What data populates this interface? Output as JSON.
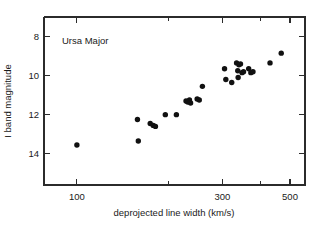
{
  "chart_data": {
    "type": "scatter",
    "title": "Ursa Major",
    "xlabel": "deprojected line width  (km/s)",
    "ylabel": "I band magnitude",
    "xscale": "log",
    "yscale": "linear",
    "xlim": [
      78,
      560
    ],
    "ylim": [
      15.6,
      7.0
    ],
    "y_inverted": true,
    "grid": false,
    "legend": null,
    "xticks_labeled": [
      100,
      300,
      500
    ],
    "xticks_minor": [
      200,
      400
    ],
    "yticks_labeled": [
      8,
      10,
      12,
      14
    ],
    "xtick_labels": [
      "100",
      "300",
      "500"
    ],
    "ytick_labels": [
      "8",
      "10",
      "12",
      "14"
    ],
    "series": [
      {
        "name": "Ursa Major galaxies",
        "marker": "filled-circle",
        "color": "#111111",
        "points": [
          {
            "x": 100,
            "y": 13.55
          },
          {
            "x": 158,
            "y": 12.25
          },
          {
            "x": 159,
            "y": 13.35
          },
          {
            "x": 174,
            "y": 12.45
          },
          {
            "x": 178,
            "y": 12.55
          },
          {
            "x": 181,
            "y": 12.6
          },
          {
            "x": 195,
            "y": 12.0
          },
          {
            "x": 212,
            "y": 12.0
          },
          {
            "x": 228,
            "y": 11.3
          },
          {
            "x": 231,
            "y": 11.35
          },
          {
            "x": 234,
            "y": 11.25
          },
          {
            "x": 236,
            "y": 11.4
          },
          {
            "x": 248,
            "y": 11.2
          },
          {
            "x": 252,
            "y": 11.25
          },
          {
            "x": 258,
            "y": 10.55
          },
          {
            "x": 305,
            "y": 9.65
          },
          {
            "x": 308,
            "y": 10.2
          },
          {
            "x": 322,
            "y": 10.35
          },
          {
            "x": 334,
            "y": 9.35
          },
          {
            "x": 337,
            "y": 9.75
          },
          {
            "x": 338,
            "y": 10.1
          },
          {
            "x": 340,
            "y": 9.45
          },
          {
            "x": 344,
            "y": 9.4
          },
          {
            "x": 348,
            "y": 9.85
          },
          {
            "x": 352,
            "y": 9.8
          },
          {
            "x": 366,
            "y": 9.65
          },
          {
            "x": 372,
            "y": 9.85
          },
          {
            "x": 378,
            "y": 9.8
          },
          {
            "x": 430,
            "y": 9.35
          },
          {
            "x": 468,
            "y": 8.85
          }
        ]
      }
    ]
  },
  "figure": {
    "annotation_label": "Ursa Major",
    "xaxis_label": "deprojected line width  (km/s)",
    "yaxis_label": "I band magnitude"
  }
}
